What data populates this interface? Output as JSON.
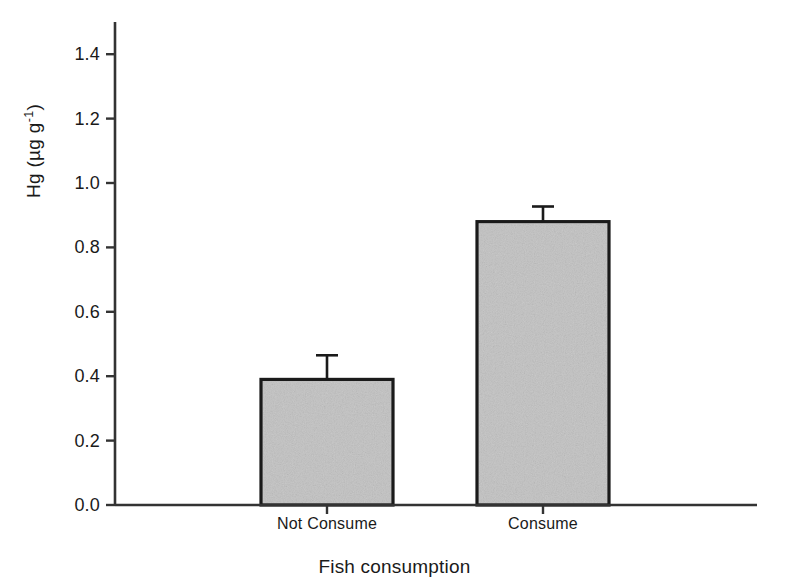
{
  "chart_data": {
    "type": "bar",
    "title": "",
    "subtitle": "",
    "xlabel": "Fish consumption",
    "ylabel": "Hg (µg g⁻¹)",
    "ylabel_parts": {
      "base": "Hg (µg g",
      "exponent": "-1",
      "tail": ")"
    },
    "categories": [
      "Not Consume",
      "Consume"
    ],
    "values": [
      0.39,
      0.88
    ],
    "errors_upper": [
      0.075,
      0.047
    ],
    "errors_lower": [
      0,
      0
    ],
    "error_type": "standard error (upper only)",
    "ylim": [
      0.0,
      1.5
    ],
    "yticks": [
      0.0,
      0.2,
      0.4,
      0.6,
      0.8,
      1.0,
      1.2,
      1.4
    ],
    "ytick_labels": [
      "0.0",
      "0.2",
      "0.4",
      "0.6",
      "0.8",
      "1.0",
      "1.2",
      "1.4"
    ],
    "grid": false,
    "legend": null,
    "legend_position": "none",
    "bar_fill_color": "#c2c2c2",
    "bar_edge_color": "#1a1a1a",
    "axis_color": "#333333",
    "background_color": "#ffffff"
  },
  "axes": {
    "y_axis_name": "mercury-concentration-axis",
    "x_axis_name": "fish-consumption-axis"
  }
}
